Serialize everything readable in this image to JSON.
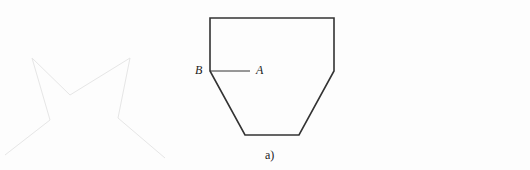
{
  "figure": {
    "caption": "a)",
    "labels": {
      "point_a": "A",
      "point_b": "B"
    },
    "shape": "hopper-like polygon with vertical sides on top and tapered bottom",
    "stroke_color": "#333333"
  },
  "background_bleed_text": [
    "（bleed-through text, illegible）"
  ]
}
